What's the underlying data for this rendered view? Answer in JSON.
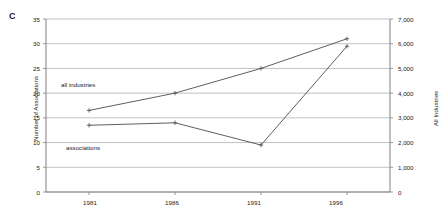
{
  "panel": {
    "label": "C"
  },
  "axes": {
    "left": {
      "title": "Number of Associations",
      "ticks": [
        "0",
        "5",
        "10",
        "15",
        "20",
        "25",
        "30",
        "35"
      ],
      "min": 0,
      "max": 35,
      "step": 5
    },
    "right": {
      "title": "All Industries",
      "ticks": [
        "0",
        "1,000",
        "2,000",
        "3,000",
        "4,000",
        "5,000",
        "6,000",
        "7,000"
      ],
      "min": 0,
      "max": 7000,
      "step": 1000
    },
    "x": {
      "title": "",
      "ticks": [
        "1981",
        "1986",
        "1991",
        "1996"
      ]
    }
  },
  "annotations": {
    "all_industries": "all industries",
    "associations": "associations"
  },
  "colors": {
    "line": "#4d4d4d",
    "grid": "#a6a6a6",
    "axis": "#808080",
    "text": "#1a1a1a"
  },
  "chart_data": {
    "type": "line",
    "title": "",
    "xlabel": "",
    "ylabel": "Number of Associations",
    "y2label": "All Industries",
    "x": [
      "1981",
      "1986",
      "1991",
      "1996"
    ],
    "ylim": [
      0,
      35
    ],
    "y2lim": [
      0,
      7000
    ],
    "grid": true,
    "legend": "inline-annotations",
    "series": [
      {
        "name": "all industries",
        "axis": "right",
        "values": [
          3300,
          4000,
          5000,
          6200
        ],
        "marker": "plus"
      },
      {
        "name": "associations",
        "axis": "left",
        "values": [
          13.5,
          14.0,
          9.5,
          29.5
        ],
        "marker": "plus"
      }
    ]
  }
}
